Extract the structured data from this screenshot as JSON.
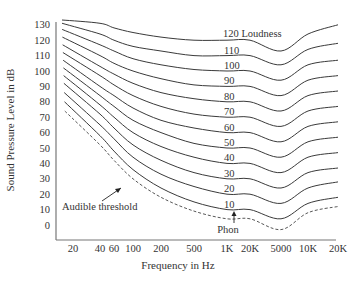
{
  "chart_data": {
    "type": "line",
    "title": "",
    "xlabel": "Frequency in Hz",
    "ylabel": "Sound Pressure Level in dB",
    "ylim": [
      0,
      130
    ],
    "x_scale": "log",
    "grid": false,
    "x_tick_labels": [
      "20",
      "40",
      "60",
      "100",
      "200",
      "500",
      "1K",
      "20K",
      "5000",
      "10K",
      "20K"
    ],
    "y_tick_labels": [
      "0",
      "10",
      "20",
      "30",
      "40",
      "50",
      "60",
      "70",
      "80",
      "90",
      "100",
      "110",
      "120",
      "130"
    ],
    "series_label_suffix": "Loudness",
    "annotations": [
      {
        "text": "Audible threshold",
        "points_to": "dashed threshold curve"
      },
      {
        "text": "Phon",
        "points_to": "10 phon curve near 1 kHz"
      },
      {
        "text": "120 Loudness",
        "points_to": "top curve"
      }
    ],
    "x": [
      20,
      40,
      60,
      100,
      200,
      500,
      1000,
      2000,
      5000,
      10000,
      20000
    ],
    "series": [
      {
        "name": "Audible threshold",
        "style": "dashed",
        "values": [
          74,
          52,
          42,
          30,
          18,
          9,
          4,
          4,
          -3,
          8,
          12
        ]
      },
      {
        "name": "10",
        "values": [
          80,
          58,
          48,
          36,
          24,
          15,
          10,
          10,
          4,
          14,
          18
        ]
      },
      {
        "name": "20",
        "values": [
          86,
          65,
          56,
          44,
          33,
          25,
          20,
          20,
          14,
          24,
          28
        ]
      },
      {
        "name": "30",
        "values": [
          92,
          72,
          63,
          52,
          42,
          34,
          30,
          30,
          24,
          34,
          37
        ]
      },
      {
        "name": "40",
        "values": [
          97,
          78,
          70,
          60,
          51,
          44,
          40,
          40,
          34,
          44,
          47
        ]
      },
      {
        "name": "50",
        "values": [
          102,
          84,
          77,
          68,
          60,
          53,
          50,
          50,
          44,
          54,
          57
        ]
      },
      {
        "name": "60",
        "values": [
          107,
          90,
          84,
          76,
          68,
          63,
          60,
          60,
          54,
          64,
          67
        ]
      },
      {
        "name": "70",
        "values": [
          112,
          97,
          91,
          84,
          77,
          72,
          70,
          70,
          64,
          74,
          77
        ]
      },
      {
        "name": "80",
        "values": [
          117,
          103,
          98,
          92,
          86,
          82,
          80,
          80,
          74,
          84,
          87
        ]
      },
      {
        "name": "90",
        "values": [
          122,
          110,
          105,
          100,
          95,
          91,
          90,
          90,
          84,
          94,
          97
        ]
      },
      {
        "name": "100",
        "values": [
          127,
          117,
          113,
          108,
          104,
          101,
          100,
          100,
          94,
          104,
          107
        ]
      },
      {
        "name": "110",
        "values": [
          131,
          124,
          120,
          116,
          113,
          110,
          110,
          110,
          104,
          114,
          118
        ]
      },
      {
        "name": "120",
        "values": [
          136,
          131,
          128,
          125,
          122,
          120,
          120,
          120,
          113,
          124,
          130
        ]
      }
    ]
  },
  "labels": {
    "loudness_120": "120 Loudness",
    "phon_values": [
      "110",
      "100",
      "90",
      "80",
      "70",
      "60",
      "50",
      "40",
      "30",
      "20",
      "10"
    ],
    "audible_threshold": "Audible threshold",
    "phon": "Phon"
  }
}
